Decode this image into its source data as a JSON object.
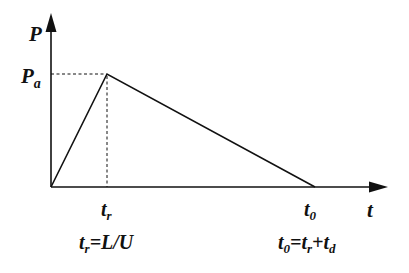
{
  "diagram": {
    "type": "triangular-pulse",
    "colors": {
      "line": "#111111",
      "background": "#ffffff"
    },
    "axes": {
      "y_label": "P",
      "x_label": "t"
    },
    "points": {
      "origin": {
        "t": 0,
        "P": 0
      },
      "peak": {
        "t_label": "tr",
        "P_label": "Pa"
      },
      "end": {
        "t_label": "t0",
        "P": 0
      }
    },
    "labels": {
      "y_axis": {
        "main": "P",
        "sub": ""
      },
      "peak_value": {
        "main": "P",
        "sub": "a"
      },
      "rise_time": {
        "main": "t",
        "sub": "r"
      },
      "end_time": {
        "main": "t",
        "sub": "0"
      },
      "x_axis": {
        "main": "t",
        "sub": ""
      }
    },
    "equations": {
      "rise_time": {
        "parts": [
          {
            "main": "t",
            "sub": "r"
          },
          {
            "text": "=L/U"
          }
        ]
      },
      "end_time": {
        "parts": [
          {
            "main": "t",
            "sub": "0"
          },
          {
            "text": "="
          },
          {
            "main": "t",
            "sub": "r"
          },
          {
            "text": "+"
          },
          {
            "main": "t",
            "sub": "d"
          }
        ]
      }
    }
  }
}
